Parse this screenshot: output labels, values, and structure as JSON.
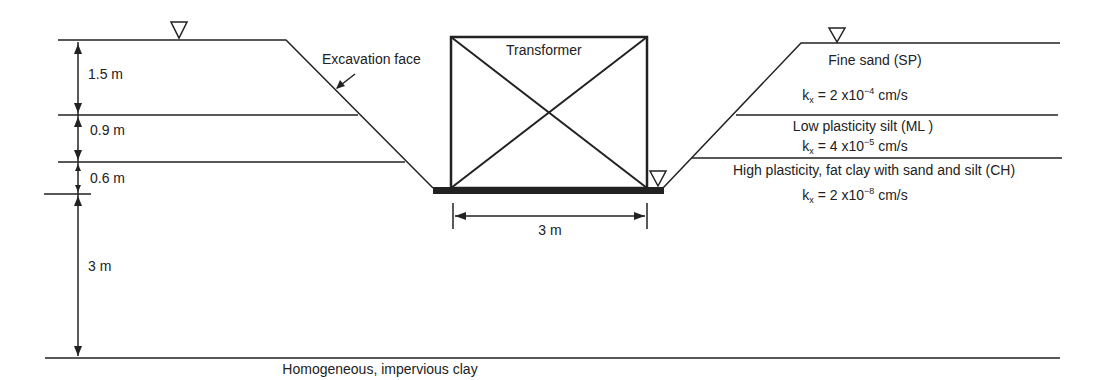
{
  "diagram": {
    "labels": {
      "excavation_face": "Excavation face",
      "transformer": "Transformer",
      "footing_width": "3 m",
      "bottom_layer": "Homogeneous, impervious clay"
    },
    "left_dimensions": [
      "1.5 m",
      "0.9 m",
      "0.6 m",
      "3 m"
    ],
    "layers": [
      {
        "name": "Fine sand (SP)",
        "k_prefix": "k",
        "k_sub": "x",
        "k_value": " = 2 x10",
        "k_exp": "−4",
        "k_unit": " cm/s"
      },
      {
        "name": "Low plasticity silt (ML )",
        "k_prefix": "k",
        "k_sub": "x",
        "k_value": " = 4 x10",
        "k_exp": "−5",
        "k_unit": " cm/s"
      },
      {
        "name": "High plasticity, fat clay with sand and silt (CH)",
        "k_prefix": "k",
        "k_sub": "x",
        "k_value": " = 2 x10",
        "k_exp": "−8",
        "k_unit": " cm/s"
      }
    ],
    "water_table_symbols": [
      "left-ground-water-table",
      "right-ground-water-table",
      "excavation-water-table"
    ],
    "line_color": "#222222"
  }
}
